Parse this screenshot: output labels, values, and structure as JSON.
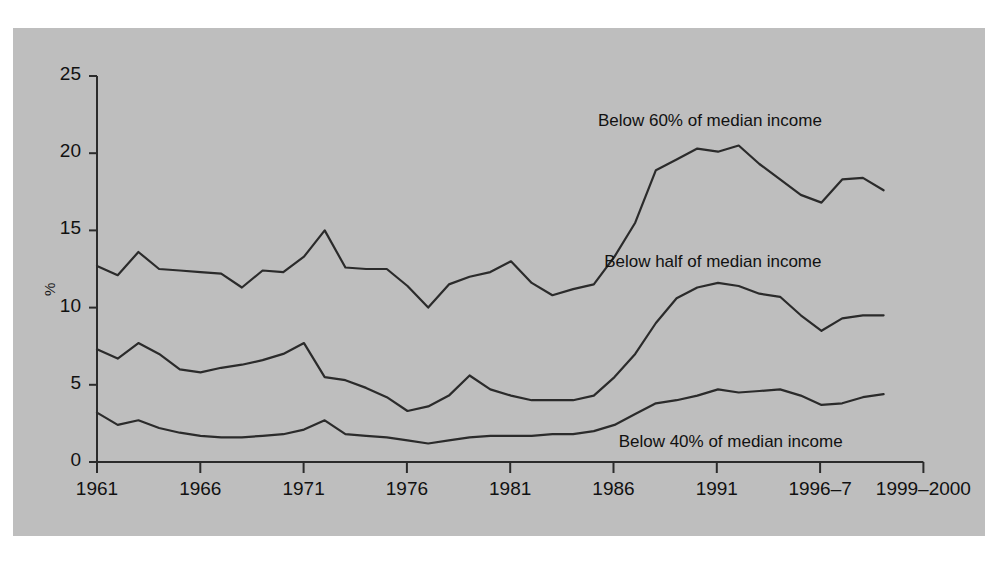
{
  "figure": {
    "background_color": "#bebebe",
    "line_color": "#2b2b2b",
    "text_color": "#111111"
  },
  "chart_data": {
    "type": "line",
    "title": "",
    "xlabel": "",
    "ylabel": "%",
    "ylim": [
      0,
      25
    ],
    "yticks": [
      0,
      5,
      10,
      15,
      20,
      25
    ],
    "ytick_labels": [
      "0",
      "5",
      "10",
      "15",
      "20",
      "25"
    ],
    "xticks": [
      1961,
      1966,
      1971,
      1976,
      1981,
      1986,
      1991,
      1996,
      1999
    ],
    "xtick_labels": [
      "1961",
      "1966",
      "1971",
      "1976",
      "1981",
      "1986",
      "1991",
      "1996–7",
      "1999–2000"
    ],
    "grid": false,
    "legend_position": "inline-annotations",
    "x": [
      1961,
      1962,
      1963,
      1964,
      1965,
      1966,
      1967,
      1968,
      1969,
      1970,
      1971,
      1972,
      1973,
      1974,
      1975,
      1976,
      1977,
      1978,
      1979,
      1980,
      1981,
      1982,
      1983,
      1984,
      1985,
      1986,
      1987,
      1988,
      1989,
      1990,
      1991,
      1992,
      1993,
      1994,
      1995,
      1996,
      1997,
      1998,
      1999
    ],
    "series": [
      {
        "name": "Below 60% of median income",
        "label_x": 1985.2,
        "label_y": 22.0,
        "values": [
          12.7,
          12.1,
          13.6,
          12.5,
          12.4,
          12.3,
          12.2,
          11.3,
          12.4,
          12.3,
          13.3,
          15.0,
          12.6,
          12.5,
          12.5,
          11.4,
          10.0,
          11.5,
          12.0,
          12.3,
          13.0,
          11.6,
          10.8,
          11.2,
          11.5,
          13.3,
          15.5,
          18.9,
          19.6,
          20.3,
          20.1,
          20.5,
          19.3,
          18.3,
          17.3,
          16.8,
          18.3,
          18.4,
          17.6
        ]
      },
      {
        "name": "Below half of median income",
        "label_x": 1985.5,
        "label_y": 12.9,
        "values": [
          7.3,
          6.7,
          7.7,
          7.0,
          6.0,
          5.8,
          6.1,
          6.3,
          6.6,
          7.0,
          7.7,
          5.5,
          5.3,
          4.8,
          4.2,
          3.3,
          3.6,
          4.3,
          5.6,
          4.7,
          4.3,
          4.0,
          4.0,
          4.0,
          4.3,
          5.5,
          7.0,
          9.0,
          10.6,
          11.3,
          11.6,
          11.4,
          10.9,
          10.7,
          9.5,
          8.5,
          9.3,
          9.5,
          9.5
        ]
      },
      {
        "name": "Below 40% of median income",
        "label_x": 1986.2,
        "label_y": 1.2,
        "values": [
          3.2,
          2.4,
          2.7,
          2.2,
          1.9,
          1.7,
          1.6,
          1.6,
          1.7,
          1.8,
          2.1,
          2.7,
          1.8,
          1.7,
          1.6,
          1.4,
          1.2,
          1.4,
          1.6,
          1.7,
          1.7,
          1.7,
          1.8,
          1.8,
          2.0,
          2.4,
          3.1,
          3.8,
          4.0,
          4.3,
          4.7,
          4.5,
          4.6,
          4.7,
          4.3,
          3.7,
          3.8,
          4.2,
          4.4
        ]
      }
    ]
  }
}
